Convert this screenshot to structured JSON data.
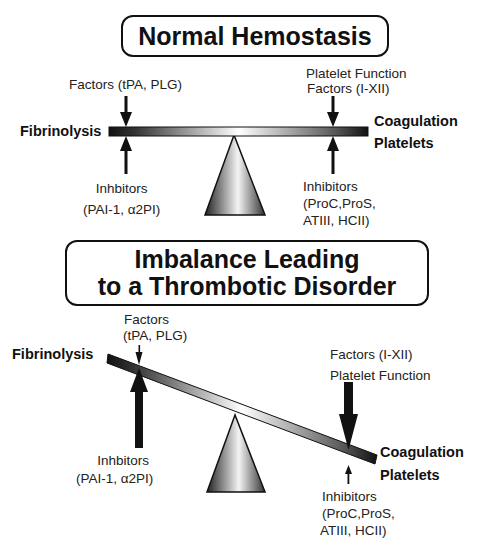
{
  "panel_normal": {
    "title": "Normal Hemostasis",
    "left_label": "Fibrinolysis",
    "right_label_line1": "Coagulation",
    "right_label_line2": "Platelets",
    "left_factors": "Factors (tPA, PLG)",
    "right_factors_line1": "Platelet Function",
    "right_factors_line2": "Factors (I-XII)",
    "left_inhibitors_line1": "Inhbitors",
    "left_inhibitors_line2": "(PAI-1, α2PI)",
    "right_inhibitors_line1": "Inhibitors",
    "right_inhibitors_line2": "(ProC,ProS,",
    "right_inhibitors_line3": "ATIII, HCII)",
    "state": "balanced"
  },
  "panel_imbalance": {
    "title_line1": "Imbalance Leading",
    "title_line2": "to a Thrombotic Disorder",
    "left_label": "Fibrinolysis",
    "right_label_line1": "Coagulation",
    "right_label_line2": "Platelets",
    "left_factors_line1": "Factors",
    "left_factors_line2": "(tPA, PLG)",
    "right_factors_line1": "Factors (I-XII)",
    "right_factors_line2": "Platelet Function",
    "left_inhibitors_line1": "Inhbitors",
    "left_inhibitors_line2": "(PAI-1, α2PI)",
    "right_inhibitors_line1": "Inhibitors",
    "right_inhibitors_line2": "(ProC,ProS,",
    "right_inhibitors_line3": "ATIII, HCII)",
    "state": "tilted toward coagulation"
  },
  "colors": {
    "ink": "#111111",
    "background": "#ffffff"
  }
}
